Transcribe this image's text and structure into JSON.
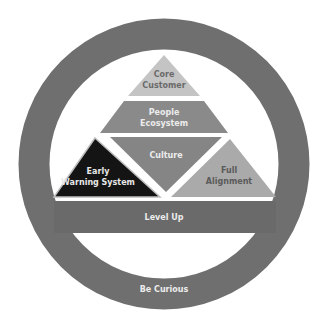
{
  "diagram": {
    "ring": {
      "label": "Be Curious",
      "color": "#6f6f6f"
    },
    "base_bar": {
      "label": "Level Up",
      "color": "#6a6a6a"
    },
    "tiers": {
      "top": {
        "label_line1": "Core",
        "label_line2": "Customer",
        "color": "#c4c4c4",
        "text_color": "#6a6a6a"
      },
      "second": {
        "label_line1": "People",
        "label_line2": "Ecosystem",
        "color": "#8a8a8a",
        "text_color": "#ececec"
      },
      "center": {
        "label": "Culture",
        "color": "#858585",
        "text_color": "#ececec"
      },
      "left": {
        "label_line1": "Early",
        "label_line2": "Warning System",
        "color": "#141414",
        "text_color": "#e8e8e8"
      },
      "right": {
        "label_line1": "Full",
        "label_line2": "Alignment",
        "color": "#aaaaaa",
        "text_color": "#5a5a5a"
      }
    }
  }
}
